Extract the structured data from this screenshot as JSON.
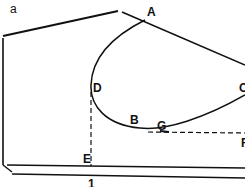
{
  "figure": {
    "panel_label": "a",
    "points": {
      "A": "A",
      "B": "B",
      "C": "C",
      "D": "D",
      "E": "E",
      "G": "G",
      "F": "F"
    },
    "dimension_label": "1"
  },
  "colors": {
    "line": "#111111",
    "background": "#ffffff"
  }
}
